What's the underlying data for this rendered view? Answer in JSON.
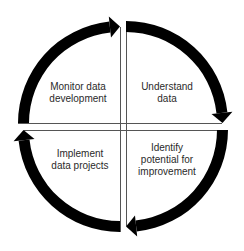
{
  "diagram": {
    "type": "cycle",
    "direction": "clockwise",
    "arrow_color": "#000000",
    "divider_color": "#555555",
    "background": "#ffffff",
    "stages": [
      {
        "id": "monitor",
        "quadrant": "top-left",
        "lines": [
          "Monitor data",
          "development"
        ]
      },
      {
        "id": "understand",
        "quadrant": "top-right",
        "lines": [
          "Understand",
          "data"
        ]
      },
      {
        "id": "identify",
        "quadrant": "bottom-right",
        "lines": [
          "Identify",
          "potential for",
          "improvement"
        ]
      },
      {
        "id": "implement",
        "quadrant": "bottom-left",
        "lines": [
          "Implement",
          "data projects"
        ]
      }
    ]
  }
}
